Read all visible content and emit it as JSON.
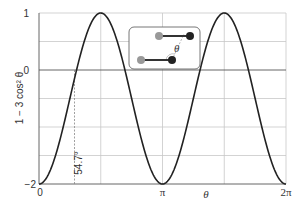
{
  "chart_data": {
    "type": "line",
    "title": "",
    "xlabel": "θ",
    "ylabel": "1 − 3 cos² θ",
    "xlim": [
      0,
      6.2832
    ],
    "ylim": [
      -2,
      1
    ],
    "x_ticks": [
      {
        "value": 0,
        "label": "0"
      },
      {
        "value": 3.1416,
        "label": "π"
      },
      {
        "value": 6.2832,
        "label": "2π"
      }
    ],
    "y_ticks": [
      {
        "value": -2,
        "label": "−2"
      },
      {
        "value": 0,
        "label": "0"
      },
      {
        "value": 1,
        "label": "1"
      }
    ],
    "grid": true,
    "series": [
      {
        "name": "1 − 3 cos² θ",
        "x": [
          0,
          0.7854,
          0.9553,
          1.5708,
          2.1863,
          2.3562,
          3.1416,
          3.927,
          4.0969,
          4.7124,
          5.3279,
          5.4978,
          6.2832
        ],
        "values": [
          -2,
          -0.5,
          0,
          1,
          0,
          -0.5,
          -2,
          -0.5,
          0,
          1,
          0,
          -0.5,
          -2
        ]
      }
    ],
    "annotations": [
      {
        "type": "vline-dashed",
        "x": 0.9553,
        "label": "54.7°"
      },
      {
        "type": "inset",
        "description": "two dipoles (dumbbells) separated by angle θ",
        "label": "θ"
      }
    ]
  },
  "labels": {
    "y_axis": "1 − 3 cos² θ",
    "x_axis": "θ",
    "y1": "1",
    "y0": "0",
    "ym2": "−2",
    "x0": "0",
    "xpi": "π",
    "x2pi": "2π",
    "angle": "54.7°",
    "inset_theta": "θ"
  }
}
